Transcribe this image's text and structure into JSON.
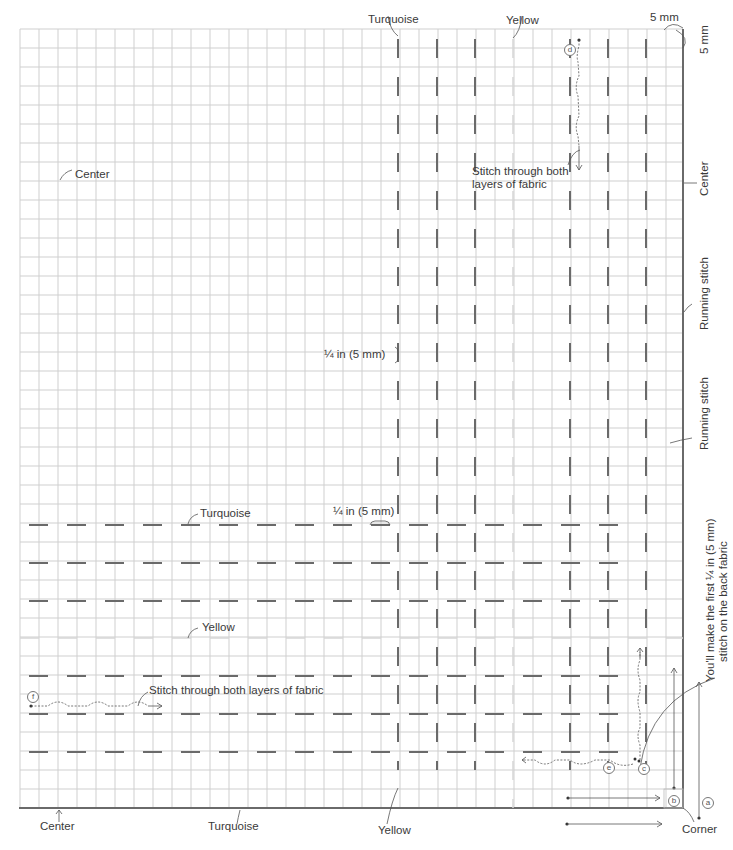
{
  "diagram": {
    "grid": {
      "left": 20,
      "top": 29,
      "cell": 19,
      "cols": 35,
      "rows": 41,
      "line_color": "#cfcfcf",
      "border_color": "#6a6a6a"
    },
    "colors": {
      "turquoise_stitch": "#6a6a6a",
      "yellow_stitch": "#d6d6d6",
      "annotation": "#555555"
    }
  },
  "labels": {
    "top_turquoise": "Turquoise",
    "top_yellow": "Yellow",
    "top_5mm_h": "5 mm",
    "right_5mm_v": "5 mm",
    "center_left": "Center",
    "stitch_through_top_line1": "Stitch through both",
    "stitch_through_top_line2": "layers of fabric",
    "right_center": "Center",
    "running_stitch_1": "Running stitch",
    "running_stitch_2": "Running stitch",
    "quarter_in_vertical": "¼ in (5 mm)",
    "quarter_in_horizontal": "¼ in (5 mm)",
    "row_turquoise": "Turquoise",
    "row_yellow": "Yellow",
    "stitch_through_bottom": "Stitch through both layers of fabric",
    "right_note_line1": "You'll make the first ¼ in (5 mm)",
    "right_note_line2": "stitch on the back fabric",
    "bottom_center": "Center",
    "bottom_turquoise": "Turquoise",
    "bottom_yellow": "Yellow",
    "bottom_corner": "Corner"
  },
  "markers": {
    "a": "a",
    "b": "b",
    "c": "c",
    "d": "d",
    "e": "e",
    "f": "f"
  },
  "stitches": {
    "vertical_turquoise_columns_x": [
      398,
      437,
      475,
      570,
      608,
      646
    ],
    "vertical_yellow_column_x": 513,
    "horizontal_turquoise_rows_y": [
      525,
      563,
      601,
      676,
      714,
      752
    ],
    "horizontal_yellow_row_y": 638
  }
}
